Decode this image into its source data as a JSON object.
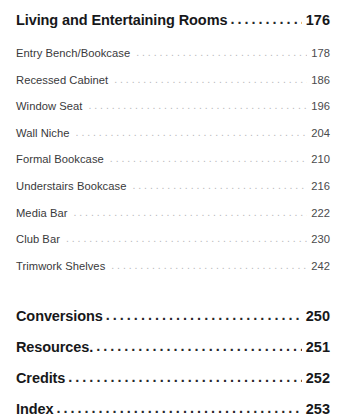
{
  "document": {
    "type": "table-of-contents",
    "background_color": "#ffffff",
    "text_color": "#17181a",
    "muted_text_color": "#39393b",
    "leader_dot_color": "#b9b9bb"
  },
  "section": {
    "title": "Living and Entertaining Rooms",
    "page": "176"
  },
  "entries": [
    {
      "title": "Entry Bench/Bookcase",
      "page": "178"
    },
    {
      "title": "Recessed Cabinet",
      "page": "186"
    },
    {
      "title": "Window Seat",
      "page": "196"
    },
    {
      "title": "Wall Niche",
      "page": "204"
    },
    {
      "title": "Formal Bookcase",
      "page": "210"
    },
    {
      "title": "Understairs Bookcase",
      "page": "216"
    },
    {
      "title": "Media Bar",
      "page": "222"
    },
    {
      "title": "Club Bar",
      "page": "230"
    },
    {
      "title": "Trimwork Shelves",
      "page": "242"
    }
  ],
  "back_matter": [
    {
      "title": "Conversions",
      "page": "250"
    },
    {
      "title": "Resources.",
      "page": "251"
    },
    {
      "title": "Credits",
      "page": "252"
    },
    {
      "title": "Index",
      "page": "253"
    }
  ],
  "leaders": {
    "section_dots": "...........................................................",
    "entry_dots": "................................................................................"
  }
}
